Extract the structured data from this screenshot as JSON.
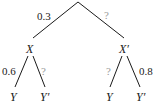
{
  "diagram": {
    "type": "probability-tree",
    "root": {
      "branches": [
        {
          "label": "0.3",
          "known": true,
          "to": "X"
        },
        {
          "label": "?",
          "known": false,
          "to": "X′"
        }
      ]
    },
    "nodes": {
      "X": {
        "label": "X",
        "branches": [
          {
            "label": "0.6",
            "known": true,
            "to": "Y"
          },
          {
            "label": "?",
            "known": false,
            "to": "Y′"
          }
        ]
      },
      "X_prime": {
        "label": "X′",
        "branches": [
          {
            "label": "?",
            "known": false,
            "to": "Y"
          },
          {
            "label": "0.8",
            "known": true,
            "to": "Y′"
          }
        ]
      }
    },
    "leaves": [
      "Y",
      "Y′",
      "Y",
      "Y′"
    ],
    "colors": {
      "line": "#1a1a1a",
      "text": "#1a1a1a",
      "unknown": "#9a9a9a"
    }
  }
}
